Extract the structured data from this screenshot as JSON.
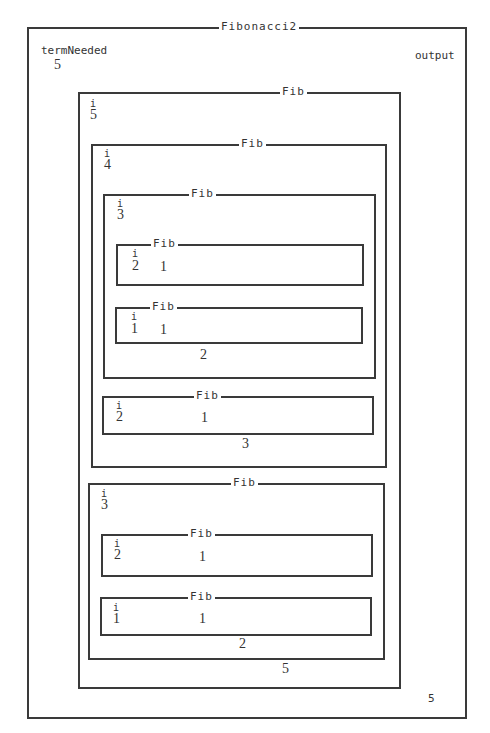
{
  "diagram": {
    "title": "Fibonacci2",
    "parameter_label": "termNeeded",
    "parameter_value": "5",
    "output_label": "output",
    "output_value": "5"
  },
  "frames": {
    "fib5": {
      "title": "Fib",
      "var_label": "i",
      "i": "5",
      "result": "5"
    },
    "fib4": {
      "title": "Fib",
      "var_label": "i",
      "i": "4",
      "result": "3"
    },
    "fib3a": {
      "title": "Fib",
      "var_label": "i",
      "i": "3",
      "result": "2"
    },
    "fib2a": {
      "title": "Fib",
      "var_label": "i",
      "i": "2",
      "result": "1"
    },
    "fib1a": {
      "title": "Fib",
      "var_label": "i",
      "i": "1",
      "result": "1"
    },
    "fib2b": {
      "title": "Fib",
      "var_label": "i",
      "i": "2",
      "result": "1"
    },
    "fib3b": {
      "title": "Fib",
      "var_label": "i",
      "i": "3",
      "result": "2"
    },
    "fib2c": {
      "title": "Fib",
      "var_label": "i",
      "i": "2",
      "result": "1"
    },
    "fib1b": {
      "title": "Fib",
      "var_label": "i",
      "i": "1",
      "result": "1"
    }
  }
}
